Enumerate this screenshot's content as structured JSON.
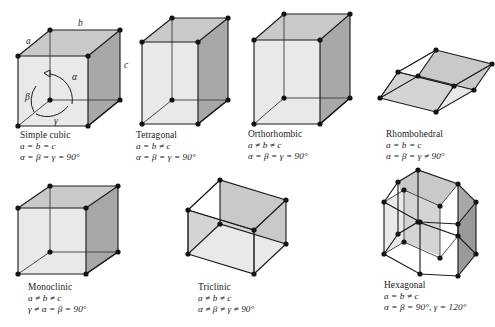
{
  "figure": {
    "background": "#ffffff",
    "ink": "#1a1a1a",
    "face_light": "#e9e9e9",
    "face_mid": "#d4d4d4",
    "face_dark": "#a8a8a8"
  },
  "axis_labels": {
    "a": "a",
    "b": "b",
    "c": "c",
    "alpha": "α",
    "beta": "β",
    "gamma": "γ"
  },
  "systems": [
    {
      "key": "simple-cubic",
      "name": "Simple cubic",
      "edge_relation": "a = b = c",
      "angle_relation": "α = β = γ = 90°"
    },
    {
      "key": "tetragonal",
      "name": "Tetragonal",
      "edge_relation": "a = b ≠ c",
      "angle_relation": "α = β = γ = 90°"
    },
    {
      "key": "orthorhombic",
      "name": "Orthorhombic",
      "edge_relation": "a ≠ b ≠ c",
      "angle_relation": "α = β = γ = 90°"
    },
    {
      "key": "rhombohedral",
      "name": "Rhombohedral",
      "edge_relation": "a = b = c",
      "angle_relation": "α = β = γ ≠ 90°"
    },
    {
      "key": "monoclinic",
      "name": "Monoclinic",
      "edge_relation": "a ≠ b ≠ c",
      "angle_relation": "γ ≠ α = β = 90°"
    },
    {
      "key": "triclinic",
      "name": "Triclinic",
      "edge_relation": "a ≠ b ≠ c",
      "angle_relation": "α ≠ β ≠ γ ≠ 90°"
    },
    {
      "key": "hexagonal",
      "name": "Hexagonal",
      "edge_relation": "a = b ≠ c",
      "angle_relation": "α = β = 90°, γ = 120°"
    }
  ]
}
